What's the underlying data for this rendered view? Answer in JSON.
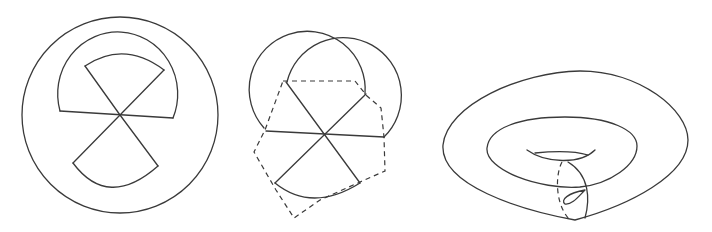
{
  "figures": [
    {
      "id": "left",
      "description": "circle with semicircular band and two opposite sector wedges meeting at center"
    },
    {
      "id": "middle",
      "description": "two overlapping circles with six-ray star and dashed hexagon outline"
    },
    {
      "id": "right",
      "description": "torus with meridian loop (dashed back half) and small twisted loop"
    }
  ],
  "colors": {
    "stroke": "#3a3a3a",
    "background": "#ffffff"
  }
}
